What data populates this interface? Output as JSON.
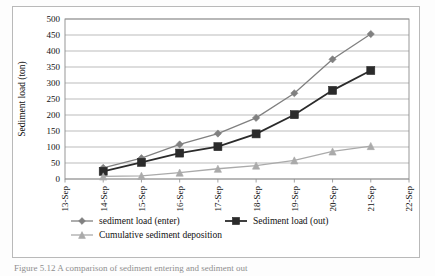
{
  "figure": {
    "caption": "Figure 5.12  A comparison of sediment entering and sediment out"
  },
  "chart_data": {
    "type": "line",
    "title": "",
    "xlabel": "",
    "ylabel": "Sediment load (ton)",
    "categories": [
      "13-Sep",
      "14-Sep",
      "15-Sep",
      "16-Sep",
      "17-Sep",
      "18-Sep",
      "19-Sep",
      "20-Sep",
      "21-Sep",
      "22-Sep"
    ],
    "ylim": [
      0,
      500
    ],
    "ytick_step": 50,
    "yticks": [
      0,
      50,
      100,
      150,
      200,
      250,
      300,
      350,
      400,
      450,
      500
    ],
    "grid": "horizontal",
    "legend_position": "bottom",
    "series": [
      {
        "name": "sediment load (enter)",
        "marker": "diamond",
        "color": "#808080",
        "x": [
          "14-Sep",
          "15-Sep",
          "16-Sep",
          "17-Sep",
          "18-Sep",
          "19-Sep",
          "20-Sep",
          "21-Sep"
        ],
        "values": [
          35,
          65,
          108,
          142,
          191,
          268,
          374,
          453
        ]
      },
      {
        "name": "Sediment load (out)",
        "marker": "square",
        "color": "#2b2b2b",
        "x": [
          "14-Sep",
          "15-Sep",
          "16-Sep",
          "17-Sep",
          "18-Sep",
          "19-Sep",
          "20-Sep",
          "21-Sep"
        ],
        "values": [
          24,
          52,
          81,
          101,
          141,
          201,
          277,
          339
        ]
      },
      {
        "name": "Cumulative sediment deposition",
        "marker": "triangle",
        "color": "#aaaaaa",
        "x": [
          "14-Sep",
          "15-Sep",
          "16-Sep",
          "17-Sep",
          "18-Sep",
          "19-Sep",
          "20-Sep",
          "21-Sep"
        ],
        "values": [
          8,
          10,
          20,
          32,
          42,
          58,
          86,
          103
        ]
      }
    ]
  },
  "legend": {
    "items": [
      {
        "label": "sediment load (enter)",
        "marker": "diamond",
        "color": "#808080"
      },
      {
        "label": "Sediment load (out)",
        "marker": "square",
        "color": "#2b2b2b"
      },
      {
        "label": "Cumulative sediment deposition",
        "marker": "triangle",
        "color": "#aaaaaa"
      }
    ]
  }
}
